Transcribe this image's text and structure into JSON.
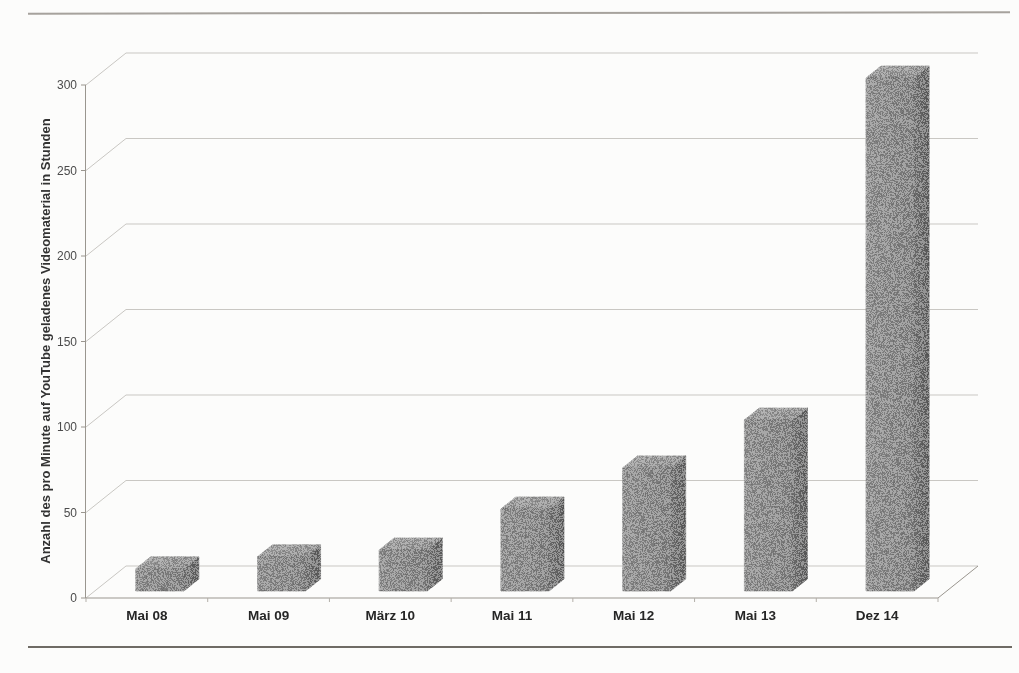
{
  "chart_data": {
    "type": "bar",
    "variant": "3d-column",
    "title": "",
    "xlabel": "",
    "ylabel": "Anzahl des pro Minute auf YouTube geladenes Videomaterial in Stunden",
    "categories": [
      "Mai 08",
      "Mai 09",
      "März 10",
      "Mai 11",
      "Mai 12",
      "Mai 13",
      "Dez 14"
    ],
    "values": [
      13,
      20,
      24,
      48,
      72,
      100,
      300
    ],
    "yticks": [
      0,
      50,
      100,
      150,
      200,
      250,
      300
    ],
    "ylim": [
      0,
      300
    ],
    "grid": true,
    "legend": "none",
    "colors": {
      "bar_front": "#8e8e8e",
      "bar_top": "#a4a4a4",
      "bar_side": "#6d6d6d",
      "bar_edge_highlight": "#c2c2c2",
      "gridline": "#c9c7c3",
      "axis": "#9a968f",
      "tick_label": "#4b4b4b",
      "category_label": "#262626",
      "axis_title": "#333333",
      "page_rule_top": "#97928c",
      "page_rule_bottom": "#6f6b65"
    }
  }
}
